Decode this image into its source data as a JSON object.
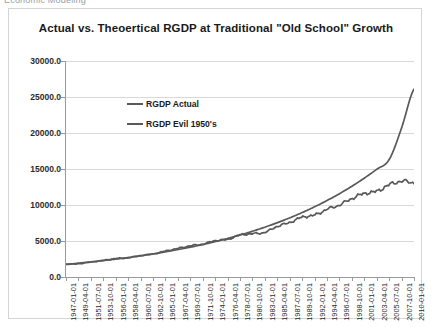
{
  "capture": {
    "clipped_top_text": "Economic Modeling"
  },
  "chart": {
    "title": "Actual vs. Theoertical  RGDP at Traditional \"Old School\" Growth",
    "series_colors": [
      "#595959",
      "#595959"
    ],
    "legend_position": "inside-top-left"
  },
  "chart_data": {
    "type": "line",
    "title": "Actual vs. Theoertical  RGDP at Traditional \"Old School\" Growth",
    "xlabel": "",
    "ylabel": "",
    "ylim": [
      0.0,
      30000.0
    ],
    "ytick_labels": [
      "30000.0",
      "25000.0",
      "20000.0",
      "15000.0",
      "10000.0",
      "5000.0",
      "0.0"
    ],
    "ytick_values": [
      30000,
      25000,
      20000,
      15000,
      10000,
      5000,
      0
    ],
    "grid": true,
    "legend": [
      "RGDP Actual",
      "RGDP Evil 1950's"
    ],
    "xtick_labels": [
      "1947-01-01",
      "1949-04-01",
      "1951-07-01",
      "1953-10-01",
      "1956-01-01",
      "1958-04-01",
      "1960-07-01",
      "1962-10-01",
      "1965-01-01",
      "1967-04-01",
      "1969-07-01",
      "1971-10-01",
      "1974-01-01",
      "1976-04-01",
      "1978-07-01",
      "1980-10-01",
      "1983-01-01",
      "1985-04-01",
      "1987-07-01",
      "1989-10-01",
      "1992-01-01",
      "1994-04-01",
      "1996-07-01",
      "1998-10-01",
      "2001-01-01",
      "2003-04-01",
      "2005-07-01",
      "2007-10-01",
      "2010-01-01"
    ],
    "x": [
      1947.0,
      1949.25,
      1951.5,
      1953.75,
      1956.0,
      1958.25,
      1960.5,
      1962.75,
      1965.0,
      1967.25,
      1969.5,
      1971.75,
      1974.0,
      1976.25,
      1978.5,
      1980.75,
      1983.0,
      1985.25,
      1987.5,
      1989.75,
      1992.0,
      1994.25,
      1996.5,
      1998.75,
      2001.0,
      2003.25,
      2005.5,
      2007.75,
      2010.0
    ],
    "series": [
      {
        "name": "RGDP Actual",
        "color": "#595959",
        "values": [
          1770,
          1840,
          2080,
          2310,
          2560,
          2660,
          2980,
          3200,
          3600,
          3960,
          4330,
          4560,
          5050,
          5220,
          5840,
          6010,
          6200,
          7030,
          7570,
          8310,
          8600,
          9400,
          10000,
          10900,
          11600,
          11900,
          12800,
          13300,
          13100
        ]
      },
      {
        "name": "RGDP Evil 1950's",
        "color": "#595959",
        "values": [
          1770,
          1920,
          2090,
          2280,
          2480,
          2700,
          2940,
          3200,
          3490,
          3800,
          4140,
          4510,
          4910,
          5350,
          5830,
          6350,
          6920,
          7540,
          8210,
          8950,
          9750,
          10620,
          11570,
          12600,
          13730,
          14960,
          16300,
          20700,
          26100
        ]
      }
    ],
    "annotations": [
      "Both series track closely until roughly 1980, then the theoretical 'Evil 1950's' trend grows exponentially to about 26000 while the actual series flattens near 13300."
    ]
  }
}
